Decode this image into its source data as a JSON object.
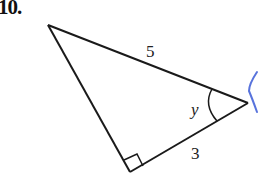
{
  "problem": {
    "number": "10."
  },
  "figure": {
    "type": "right-triangle",
    "sides": {
      "hypotenuse": "5",
      "adjacent": "3"
    },
    "angle_label": "y",
    "right_angle_marker": true,
    "colors": {
      "stroke": "#1a1a1a",
      "annotation": "#3b5bd6"
    }
  }
}
